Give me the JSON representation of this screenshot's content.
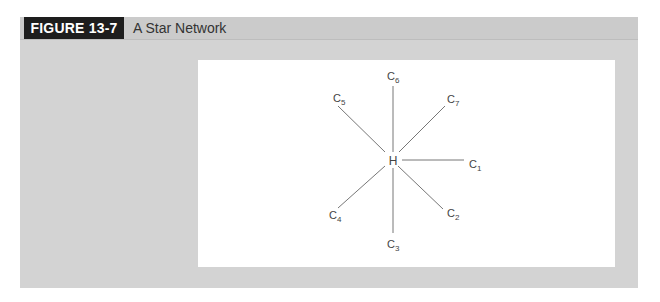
{
  "figure": {
    "label": "FIGURE 13-7",
    "title": "A Star Network"
  },
  "diagram": {
    "type": "star-network",
    "hub": {
      "id": "H",
      "label": "H"
    },
    "nodes": [
      {
        "id": "C1",
        "base": "C",
        "sub": "1"
      },
      {
        "id": "C2",
        "base": "C",
        "sub": "2"
      },
      {
        "id": "C3",
        "base": "C",
        "sub": "3"
      },
      {
        "id": "C4",
        "base": "C",
        "sub": "4"
      },
      {
        "id": "C5",
        "base": "C",
        "sub": "5"
      },
      {
        "id": "C6",
        "base": "C",
        "sub": "6"
      },
      {
        "id": "C7",
        "base": "C",
        "sub": "7"
      }
    ],
    "edges": [
      [
        "H",
        "C1"
      ],
      [
        "H",
        "C2"
      ],
      [
        "H",
        "C3"
      ],
      [
        "H",
        "C4"
      ],
      [
        "H",
        "C5"
      ],
      [
        "H",
        "C6"
      ],
      [
        "H",
        "C7"
      ]
    ],
    "colors": {
      "line": "#666666",
      "text": "#444444"
    }
  }
}
